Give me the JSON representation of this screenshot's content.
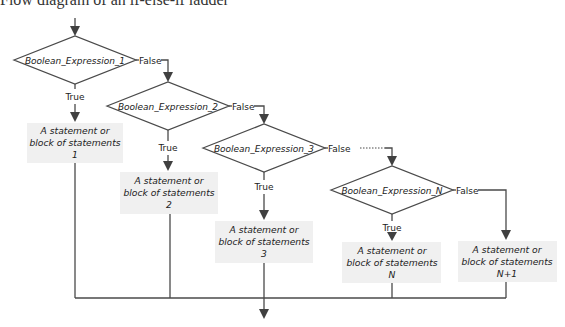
{
  "caption": "Flow diagram of an if-else-if ladder",
  "diagram": {
    "line_color": "#4a4a4a",
    "box_fill": "#f0f0f0",
    "conditions": [
      {
        "label": "Boolean_Expression_1",
        "true_label": "True",
        "false_label": "False"
      },
      {
        "label": "Boolean_Expression_2",
        "true_label": "True",
        "false_label": "False"
      },
      {
        "label": "Boolean_Expression_3",
        "true_label": "True",
        "false_label": "False"
      },
      {
        "label": "Boolean_Expression_N",
        "true_label": "True",
        "false_label": "False"
      }
    ],
    "statements": [
      {
        "line1": "A statement or",
        "line2": "block of statements",
        "line3": "1"
      },
      {
        "line1": "A statement or",
        "line2": "block of statements",
        "line3": "2"
      },
      {
        "line1": "A statement or",
        "line2": "block of statements",
        "line3": "3"
      },
      {
        "line1": "A statement or",
        "line2": "block of statements",
        "line3": "N"
      },
      {
        "line1": "A statement or",
        "line2": "block of statements",
        "line3": "N+1"
      }
    ]
  }
}
